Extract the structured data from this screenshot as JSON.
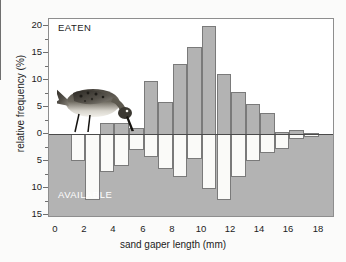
{
  "chart_data": {
    "type": "bar",
    "title": "",
    "subtitle": "",
    "xlabel": "sand gaper length (mm)",
    "ylabel": "relative frequency (%)",
    "orientation": "back-to-back histogram",
    "grid": false,
    "legend_position": "inside-plot",
    "xlim": [
      0,
      19
    ],
    "ylim": [
      -16,
      21
    ],
    "bin_width_mm": 1,
    "x_ticks": [
      0,
      2,
      4,
      6,
      8,
      10,
      12,
      14,
      16,
      18
    ],
    "x_tick_labels": [
      "0",
      "2",
      "4",
      "6",
      "8",
      "10",
      "12",
      "14",
      "16",
      "18"
    ],
    "x_minor_ticks": [
      1,
      3,
      5,
      7,
      9,
      11,
      13,
      15,
      17,
      19
    ],
    "y_ticks": [
      20,
      15,
      10,
      5,
      0,
      -5,
      -10,
      -15
    ],
    "y_tick_labels": [
      "20",
      "15",
      "10",
      "5",
      "0",
      "5",
      "10",
      "15"
    ],
    "annotations": [
      {
        "name": "eaten-label",
        "text": "EATEN",
        "position": "top-left",
        "color": "#1c1c1c"
      },
      {
        "name": "available-label",
        "text": "AVAILABLE",
        "position": "bottom-left",
        "color": "#ffffff"
      }
    ],
    "colors": {
      "eaten_fill": "#b3b3b3",
      "eaten_stroke": "#7a7a7a",
      "available_fill": "#fafaf8",
      "available_stroke": "#7a7a7a",
      "available_field": "#b3b3b3",
      "axis": "#8e8e8e",
      "text": "#1c1c1c",
      "background": "#ffffff"
    },
    "bin_centers": [
      0.5,
      1.5,
      2.5,
      3.5,
      4.5,
      5.5,
      6.5,
      7.5,
      8.5,
      9.5,
      10.5,
      11.5,
      12.5,
      13.5,
      14.5,
      15.5,
      16.5,
      17.5,
      18.5
    ],
    "series": [
      {
        "name": "EATEN",
        "direction": "up",
        "values": [
          0,
          0,
          0,
          2.0,
          2.0,
          1.2,
          9.8,
          6.0,
          13.0,
          16.2,
          20.0,
          11.2,
          7.8,
          5.6,
          3.8,
          0.3,
          0.8,
          0.2,
          0
        ]
      },
      {
        "name": "AVAILABLE",
        "direction": "down",
        "values": [
          0,
          5.0,
          12.2,
          7.0,
          6.0,
          3.0,
          4.2,
          6.5,
          8.0,
          4.7,
          10.2,
          12.3,
          8.0,
          5.0,
          3.5,
          2.8,
          1.0,
          0.5,
          0
        ]
      }
    ]
  },
  "figure": {
    "photo_caption": "wading-bird-photo"
  }
}
